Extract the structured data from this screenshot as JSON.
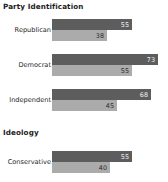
{
  "chart_data": {
    "type": "bar",
    "orientation": "horizontal",
    "title": "",
    "xlabel": "",
    "ylabel": "",
    "xlim": [
      0,
      80
    ],
    "grid": false,
    "legend": "none",
    "colors": {
      "series_1": "#5d5d5d",
      "series_2": "#ababab",
      "background": "#ffffff",
      "text": "#262626"
    },
    "sections": [
      {
        "heading": "Party Identification",
        "categories": [
          "Republican",
          "Democrat",
          "Independent"
        ],
        "series": [
          {
            "name": "series_1",
            "values": [
              55,
              73,
              68
            ]
          },
          {
            "name": "series_2",
            "values": [
              38,
              55,
              45
            ]
          }
        ]
      },
      {
        "heading": "Ideology",
        "categories": [
          "Conservative"
        ],
        "series": [
          {
            "name": "series_1",
            "values": [
              55
            ]
          },
          {
            "name": "series_2",
            "values": [
              40
            ]
          }
        ]
      }
    ]
  },
  "sections": {
    "party": {
      "heading": "Party Identification",
      "rows": [
        {
          "label": "Republican",
          "dark": "55",
          "light": "38"
        },
        {
          "label": "Democrat",
          "dark": "73",
          "light": "55"
        },
        {
          "label": "Independent",
          "dark": "68",
          "light": "45"
        }
      ]
    },
    "ideology": {
      "heading": "Ideology",
      "rows": [
        {
          "label": "Conservative",
          "dark": "55",
          "light": "40"
        }
      ]
    }
  }
}
